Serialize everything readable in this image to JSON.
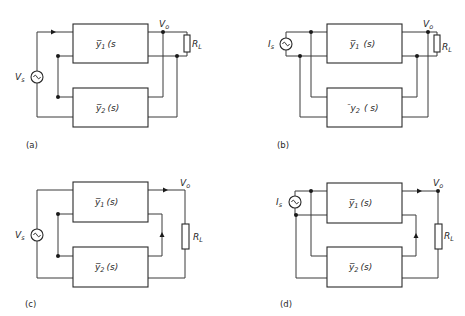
{
  "figure": {
    "panels": [
      {
        "id": "a",
        "caption": "(a)",
        "source": {
          "type": "voltage",
          "symbol": "V",
          "subscript": "s"
        },
        "blocks": [
          {
            "label": "y̅",
            "sub": "1",
            "arg": "(s"
          },
          {
            "label": "y̅",
            "sub": "2",
            "arg": "(s)"
          }
        ],
        "output": {
          "symbol": "V",
          "subscript": "o"
        },
        "load": {
          "symbol": "R",
          "subscript": "L"
        }
      },
      {
        "id": "b",
        "caption": "(b)",
        "source": {
          "type": "current",
          "symbol": "I",
          "subscript": "s"
        },
        "blocks": [
          {
            "label": "y̅",
            "sub": "1",
            "arg": "(s)"
          },
          {
            "label": "¯y",
            "sub": "2",
            "arg": "( s)"
          }
        ],
        "output": {
          "symbol": "V",
          "subscript": "o"
        },
        "load": {
          "symbol": "R",
          "subscript": "L"
        }
      },
      {
        "id": "c",
        "caption": "(c)",
        "source": {
          "type": "voltage",
          "symbol": "V",
          "subscript": "s"
        },
        "blocks": [
          {
            "label": "y̅",
            "sub": "1",
            "arg": "(s)"
          },
          {
            "label": "y̅",
            "sub": "2",
            "arg": "(s)"
          }
        ],
        "output": {
          "symbol": "V",
          "subscript": "o"
        },
        "load": {
          "symbol": "R",
          "subscript": "L"
        }
      },
      {
        "id": "d",
        "caption": "(d)",
        "source": {
          "type": "current",
          "symbol": "I",
          "subscript": "s"
        },
        "blocks": [
          {
            "label": "y̅",
            "sub": "1",
            "arg": "(s)"
          },
          {
            "label": "y̅",
            "sub": "2",
            "arg": "(s)"
          }
        ],
        "output": {
          "symbol": "V",
          "subscript": "o"
        },
        "load": {
          "symbol": "R",
          "subscript": "L"
        }
      }
    ],
    "colors": {
      "ink": "#2a2a2a",
      "background": "#ffffff"
    }
  }
}
